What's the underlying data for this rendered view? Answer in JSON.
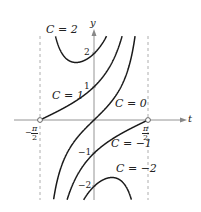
{
  "figure": {
    "axes": {
      "x_label": "t",
      "y_label": "y"
    },
    "y_ticks": [
      "2",
      "1",
      "−1",
      "−2"
    ],
    "x_ticks": [
      {
        "sign": "−",
        "num": "π",
        "den": "2"
      },
      {
        "sign": "",
        "num": "π",
        "den": "2"
      }
    ],
    "curve_labels": [
      "C = 2",
      "C = 1",
      "C = 0",
      "C = −1",
      "C = −2"
    ],
    "colors": {
      "curve": "#1a1a1a",
      "axis": "#888888",
      "asymptote": "#999999"
    }
  },
  "chart_data": {
    "type": "line",
    "title": "",
    "xlabel": "t",
    "ylabel": "y",
    "equation": "y = (C + sin t) / cos t",
    "xlim": [
      -1.5708,
      1.5708
    ],
    "ylim": [
      -2.6,
      2.8
    ],
    "vertical_asymptotes": [
      "-pi/2",
      "pi/2"
    ],
    "x_ticks": [
      "-π/2",
      "π/2"
    ],
    "y_ticks": [
      -2,
      -1,
      1,
      2
    ],
    "series": [
      {
        "name": "C = 2",
        "C": 2
      },
      {
        "name": "C = 1",
        "C": 1
      },
      {
        "name": "C = 0",
        "C": 0
      },
      {
        "name": "C = -1",
        "C": -1
      },
      {
        "name": "C = -2",
        "C": -2
      }
    ],
    "marked_points": [
      {
        "t": "-pi/2",
        "y": 0
      },
      {
        "t": "pi/2",
        "y": 0
      }
    ],
    "grid": false,
    "legend": "inline labels"
  }
}
